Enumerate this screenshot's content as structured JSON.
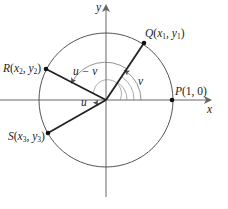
{
  "diagram": {
    "type": "unit-circle-angle-difference",
    "axes": {
      "x_label": "x",
      "y_label": "y"
    },
    "points": {
      "P": {
        "name": "P",
        "coords": "(1, 0)"
      },
      "Q": {
        "name": "Q",
        "x": "x",
        "x_sub": "1",
        "y": "y",
        "y_sub": "1"
      },
      "R": {
        "name": "R",
        "x": "x",
        "x_sub": "2",
        "y": "y",
        "y_sub": "2"
      },
      "S": {
        "name": "S",
        "x": "x",
        "x_sub": "3",
        "y": "y",
        "y_sub": "3"
      }
    },
    "angles": {
      "u_minus_v": "u − v",
      "v": "v",
      "u": "u"
    },
    "colors": {
      "stroke": "#333333",
      "circle": "#555555",
      "axis": "#666666"
    }
  }
}
